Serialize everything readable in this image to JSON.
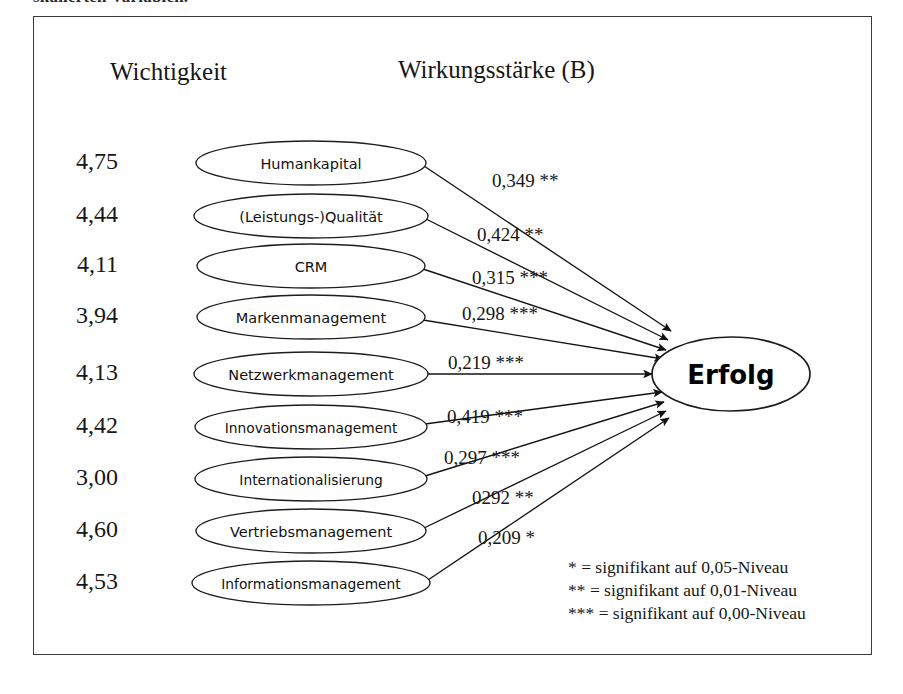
{
  "caption_tail": "skalierten Variablen.",
  "headings": {
    "left": "Wichtigkeit",
    "right": "Wirkungsstärke (B)"
  },
  "target_node": {
    "label": "Erfolg"
  },
  "drivers": [
    {
      "score": "4,75",
      "label": "Humankapital",
      "coefficient": "0,349 **"
    },
    {
      "score": "4,44",
      "label": "(Leistungs-)Qualität",
      "coefficient": "0,424 **"
    },
    {
      "score": "4,11",
      "label": "CRM",
      "coefficient": "0,315 ***"
    },
    {
      "score": "3,94",
      "label": "Markenmanagement",
      "coefficient": "0,298 ***"
    },
    {
      "score": "4,13",
      "label": "Netzwerkmanagement",
      "coefficient": "0,219 ***"
    },
    {
      "score": "4,42",
      "label": "Innovationsmanagement",
      "coefficient": "0,419 ***"
    },
    {
      "score": "3,00",
      "label": "Internationalisierung",
      "coefficient": "0,297 ***"
    },
    {
      "score": "4,60",
      "label": "Vertriebsmanagement",
      "coefficient": "0292 **"
    },
    {
      "score": "4,53",
      "label": "Informationsmanagement",
      "coefficient": "0,209 *"
    }
  ],
  "legend": [
    "* = signifikant auf 0,05-Niveau",
    "** = signifikant auf 0,01-Niveau",
    "*** = signifikant auf 0,00-Niveau"
  ],
  "chart_data": {
    "type": "diagram",
    "notation": "path diagram / structural model",
    "target": "Erfolg",
    "columns": [
      "Wichtigkeit",
      "Wirkungsstärke (B)"
    ],
    "categories": [
      "Humankapital",
      "(Leistungs-)Qualität",
      "CRM",
      "Markenmanagement",
      "Netzwerkmanagement",
      "Innovationsmanagement",
      "Internationalisierung",
      "Vertriebsmanagement",
      "Informationsmanagement"
    ],
    "series": [
      {
        "name": "Wichtigkeit",
        "values": [
          4.75,
          4.44,
          4.11,
          3.94,
          4.13,
          4.42,
          3.0,
          4.6,
          4.53
        ]
      },
      {
        "name": "Wirkungsstärke (B)",
        "values": [
          0.349,
          0.424,
          0.315,
          0.298,
          0.219,
          0.419,
          0.297,
          0.292,
          0.209
        ]
      }
    ],
    "significance": [
      "**",
      "**",
      "***",
      "***",
      "***",
      "***",
      "***",
      "**",
      "*"
    ],
    "significance_legend": {
      "*": "signifikant auf 0,05-Niveau",
      "**": "signifikant auf 0,01-Niveau",
      "***": "signifikant auf 0,00-Niveau"
    }
  },
  "geometry": {
    "target_cx": 731,
    "target_cy": 374,
    "target_rx": 79,
    "target_ry": 37,
    "node_cx": 311,
    "node_rx": 114,
    "node_ry": 22,
    "rows_cy": [
      163,
      216,
      266,
      317,
      374,
      427,
      479,
      531,
      583
    ],
    "node_rx_each": [
      115,
      117,
      114,
      114,
      117,
      116,
      116,
      115,
      119
    ],
    "score_x": 118,
    "arrow_tip_x": [
      671,
      668,
      666,
      663,
      652,
      662,
      664,
      666,
      669
    ],
    "arrow_tip_y": [
      331,
      340,
      350,
      359,
      374,
      392,
      402,
      411,
      418
    ],
    "coef_pos": [
      [
        492,
        170
      ],
      [
        477,
        224
      ],
      [
        472,
        267
      ],
      [
        462,
        303
      ],
      [
        448,
        352
      ],
      [
        447,
        406
      ],
      [
        444,
        447
      ],
      [
        472,
        487
      ],
      [
        478,
        527
      ]
    ]
  }
}
